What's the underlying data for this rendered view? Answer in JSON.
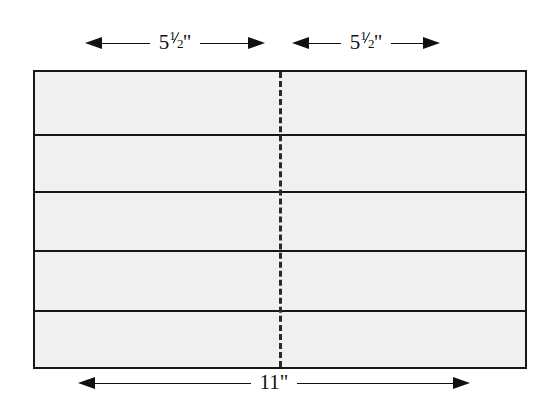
{
  "diagram": {
    "sheet": {
      "fill_color": "#f0f0f0",
      "stroke_color": "#161616",
      "band_count": 5
    },
    "fold_line": {
      "style": "dashed",
      "color": "#2a2a2a",
      "name": "center-fold"
    },
    "dimensions": {
      "top_left": {
        "value": "5",
        "fraction_numerator": "1",
        "fraction_denominator": "2",
        "unit": "\"",
        "full_label": "5½\""
      },
      "top_right": {
        "value": "5",
        "fraction_numerator": "1",
        "fraction_denominator": "2",
        "unit": "\"",
        "full_label": "5½\""
      },
      "bottom": {
        "value": "11",
        "unit": "\"",
        "full_label": "11\""
      }
    }
  }
}
